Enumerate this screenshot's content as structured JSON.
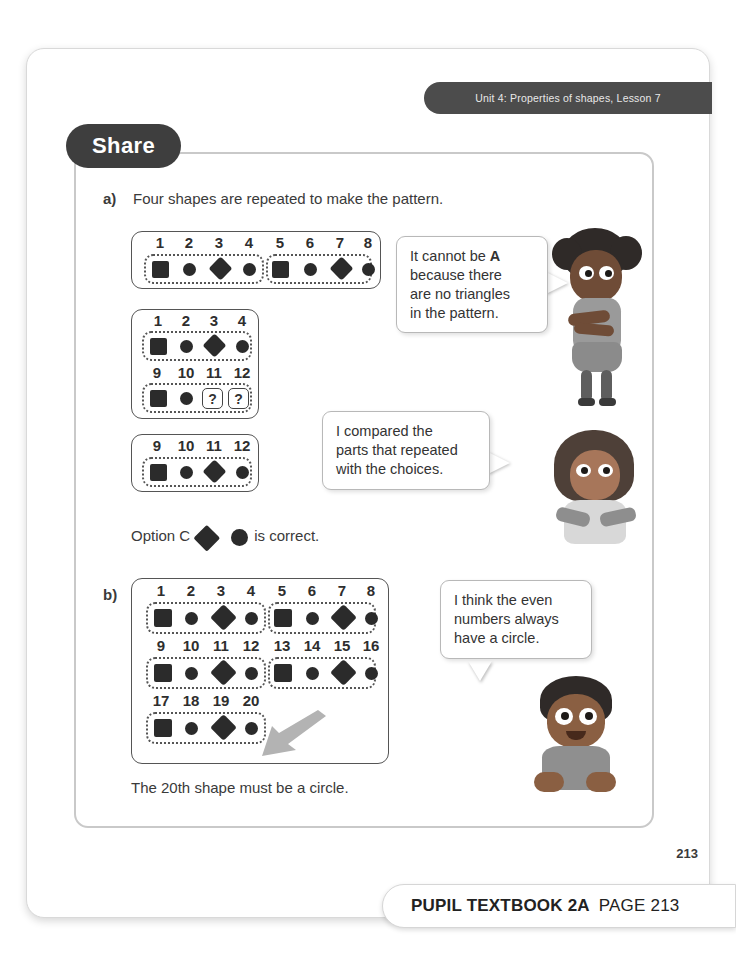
{
  "header": {
    "unit_banner": "Unit 4: Properties of shapes, Lesson 7",
    "section_tab": "Share"
  },
  "part_a": {
    "marker": "a)",
    "prompt": "Four shapes are repeated to make the pattern.",
    "pattern1": {
      "numbers": [
        "1",
        "2",
        "3",
        "4",
        "5",
        "6",
        "7",
        "8"
      ],
      "shapes": [
        "square",
        "circle",
        "diamond",
        "circle",
        "square",
        "circle",
        "diamond",
        "circle"
      ],
      "groups": [
        [
          0,
          3
        ],
        [
          4,
          7
        ]
      ]
    },
    "pattern2_top": {
      "numbers": [
        "1",
        "2",
        "3",
        "4"
      ],
      "shapes": [
        "square",
        "circle",
        "diamond",
        "circle"
      ]
    },
    "pattern2_bottom": {
      "numbers": [
        "9",
        "10",
        "11",
        "12"
      ],
      "shapes": [
        "square",
        "circle",
        "question",
        "question"
      ],
      "question_label": "?"
    },
    "pattern3": {
      "numbers": [
        "9",
        "10",
        "11",
        "12"
      ],
      "shapes": [
        "square",
        "circle",
        "diamond",
        "circle"
      ]
    },
    "answer_prefix": "Option C",
    "answer_suffix": "is correct."
  },
  "part_b": {
    "marker": "b)",
    "row1": {
      "numbers": [
        "1",
        "2",
        "3",
        "4",
        "5",
        "6",
        "7",
        "8"
      ],
      "shapes": [
        "square",
        "circle",
        "diamond",
        "circle",
        "square",
        "circle",
        "diamond",
        "circle"
      ],
      "groups": [
        [
          0,
          3
        ],
        [
          4,
          7
        ]
      ]
    },
    "row2": {
      "numbers": [
        "9",
        "10",
        "11",
        "12",
        "13",
        "14",
        "15",
        "16"
      ],
      "shapes": [
        "square",
        "circle",
        "diamond",
        "circle",
        "square",
        "circle",
        "diamond",
        "circle"
      ],
      "groups": [
        [
          0,
          3
        ],
        [
          4,
          7
        ]
      ]
    },
    "row3": {
      "numbers": [
        "17",
        "18",
        "19",
        "20"
      ],
      "shapes": [
        "square",
        "circle",
        "diamond",
        "circle"
      ],
      "groups": [
        [
          0,
          3
        ]
      ]
    },
    "conclusion": "The 20th shape must be a circle."
  },
  "bubbles": [
    {
      "id": "bubble-girl-1",
      "lines": [
        "It cannot be ",
        "A",
        " because there",
        "are no triangles",
        "in the pattern."
      ],
      "text_line1_a": "It cannot be ",
      "text_line1_bold": "A",
      "text_line2": "because there",
      "text_line3": "are no triangles",
      "text_line4": "in the pattern."
    },
    {
      "id": "bubble-girl-2",
      "text_line1": "I compared the",
      "text_line2": "parts that repeated",
      "text_line3": "with the choices."
    },
    {
      "id": "bubble-boy",
      "text_line1": "I think the even",
      "text_line2": "numbers always",
      "text_line3": "have a circle."
    }
  ],
  "footer": {
    "page_number": "213",
    "book_label": "PUPIL TEXTBOOK 2A",
    "page_label": "PAGE 213"
  },
  "colors": {
    "banner": "#4c4c4c",
    "tab": "#3e3e3e",
    "shape": "#2b2b2b",
    "text": "#3a3a3a",
    "arrow": "#b0b0b0"
  }
}
